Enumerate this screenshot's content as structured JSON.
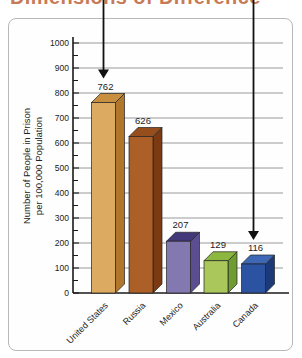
{
  "figure": {
    "title": "Dimensions of Difference",
    "title_color": "#c87a56",
    "panel_border_color": "#b8b8b8",
    "gridline_color": "#8e8e8e",
    "axis_color": "#1a1a1a",
    "text_color": "#222222",
    "arrow_color": "#111111"
  },
  "chart_data": {
    "type": "bar",
    "title": "Dimensions of Difference",
    "categories": [
      "United States",
      "Russia",
      "Mexico",
      "Australia",
      "Canada"
    ],
    "values": [
      762,
      626,
      207,
      129,
      116
    ],
    "value_labels": [
      "762",
      "626",
      "207",
      "129",
      "116"
    ],
    "xlabel": "",
    "ylabel": "Number of People in Prison per 100,000 Population",
    "ylabel_lines": [
      "Number of People in Prison",
      "per 100,000 Population"
    ],
    "ylim": [
      0,
      1000
    ],
    "ytick_interval": 100,
    "ytick_minor_interval": 50,
    "ytick_labels": [
      "0",
      "100",
      "200",
      "300",
      "400",
      "500",
      "600",
      "700",
      "800",
      "900",
      "1000"
    ],
    "grid": true,
    "legend": false,
    "bar_style": "3d",
    "bar_colors": [
      {
        "front": "#dcaa60",
        "side": "#b0762c",
        "top": "#c78f3e"
      },
      {
        "front": "#ac5f26",
        "side": "#7c3a12",
        "top": "#964e1c"
      },
      {
        "front": "#8478b0",
        "side": "#5a4d90",
        "top": "#423778"
      },
      {
        "front": "#a9c75a",
        "side": "#6e9c31",
        "top": "#8db83f"
      },
      {
        "front": "#2c52a2",
        "side": "#1c3a78",
        "top": "#3e67b6"
      }
    ],
    "annotations": [
      {
        "type": "arrow",
        "points_to": "United States"
      },
      {
        "type": "arrow",
        "points_to": "Canada"
      }
    ]
  }
}
